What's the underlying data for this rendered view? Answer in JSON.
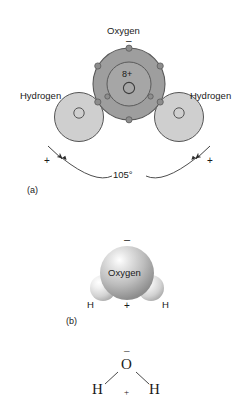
{
  "figure": {
    "background_color": "#ffffff",
    "ink_color": "#1a1a1a"
  },
  "panel_a": {
    "tag": "(a)",
    "oxygen_label": "Oxygen",
    "oxygen_partial_charge": "–",
    "nucleus_charge": "8+",
    "hydrogen_left_label": "Hydrogen",
    "hydrogen_right_label": "Hydrogen",
    "partial_positive_left": "+",
    "partial_positive_right": "+",
    "bond_angle": "105°",
    "oxygen_fill": "#9e9e9e",
    "oxygen_inner_fill": "#a8a8a8",
    "hydrogen_fill": "#cfcfcf",
    "electron_dot_fill": "#8a8a8a",
    "stroke": "#4a4a4a"
  },
  "panel_b": {
    "tag": "(b)",
    "oxygen_label": "Oxygen",
    "partial_negative": "–",
    "partial_positive": "+",
    "hydrogen_left_label": "H",
    "hydrogen_right_label": "H",
    "oxygen_sphere_color": "#b4b4b4",
    "hydrogen_sphere_color": "#dcdcdc",
    "highlight_color": "#f2f2f2"
  },
  "panel_c": {
    "oxygen_atom": "O",
    "partial_negative": "–",
    "partial_positive": "+",
    "hydrogen_left": "H",
    "hydrogen_right": "H",
    "bond_color": "#4a4a4a"
  }
}
